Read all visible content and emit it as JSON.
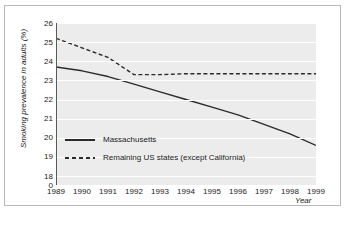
{
  "chart_data": {
    "type": "line",
    "title": "",
    "xlabel": "Year",
    "ylabel": "Smoking prevalence in adults (%)",
    "x": [
      1989,
      1990,
      1991,
      1992,
      1993,
      1994,
      1995,
      1996,
      1997,
      1998,
      1999
    ],
    "xtick_labels": [
      "1989",
      "1990",
      "1991",
      "1992",
      "1993",
      "1994",
      "1995",
      "1996",
      "1997",
      "1998",
      "1999"
    ],
    "ytick_labels": [
      "26",
      "25",
      "24",
      "23",
      "22",
      "21",
      "20",
      "19",
      "18",
      "0"
    ],
    "ytick_values": [
      26,
      25,
      24,
      23,
      22,
      21,
      20,
      19,
      18,
      0
    ],
    "ylim": [
      18,
      26
    ],
    "xlim": [
      1989,
      1999
    ],
    "axis_break": true,
    "grid": true,
    "grid_orientation": "horizontal",
    "legend_position": "inside-lower-left",
    "series": [
      {
        "name": "Massachusetts",
        "style": "solid",
        "color": "#2b2b2b",
        "values": [
          23.7,
          23.5,
          23.2,
          22.8,
          22.4,
          22.0,
          21.6,
          21.2,
          20.7,
          20.2,
          19.6
        ]
      },
      {
        "name": "Remaining US states (except California)",
        "style": "dashed",
        "color": "#2b2b2b",
        "values": [
          25.2,
          24.7,
          24.2,
          23.3,
          23.3,
          23.35,
          23.35,
          23.35,
          23.35,
          23.35,
          23.35
        ]
      }
    ]
  },
  "legend": {
    "items": [
      {
        "label": "Massachusetts",
        "style": "solid"
      },
      {
        "label": "Remaining US states (except California)",
        "style": "dashed"
      }
    ]
  },
  "colors": {
    "plot_background": "#ececec",
    "gridline": "#ffffff",
    "line": "#2b2b2b",
    "frame_border": "#b9b9b9",
    "text": "#1a1a1a"
  }
}
